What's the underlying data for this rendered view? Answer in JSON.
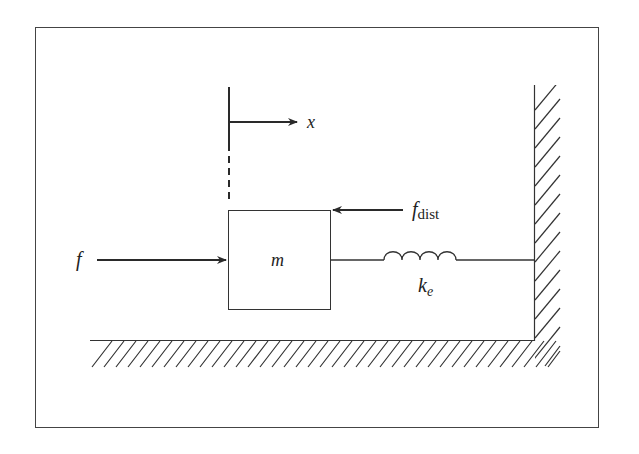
{
  "diagram": {
    "type": "mass-spring system schematic",
    "labels": {
      "displacement": "x",
      "applied_force": "f",
      "disturbance_force_main": "f",
      "disturbance_force_sub": "dist",
      "mass": "m",
      "spring_main": "k",
      "spring_sub": "e"
    },
    "colors": {
      "stroke": "#2a2a2a",
      "background": "#ffffff"
    }
  }
}
